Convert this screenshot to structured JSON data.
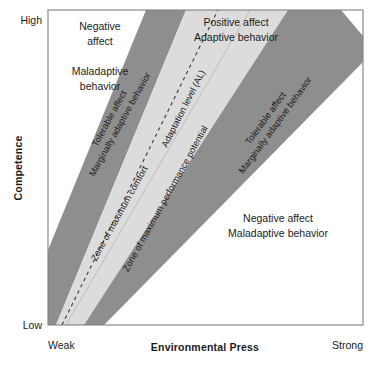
{
  "figure": {
    "type": "diagram",
    "model_name": "Environmental Press and Competence model",
    "plot_area": {
      "left": 48,
      "top": 10,
      "right": 363,
      "bottom": 325
    },
    "colors": {
      "background": "#ffffff",
      "frame": "#808080",
      "band_dark": "#8e8e8e",
      "band_light": "#dcdcdc",
      "text": "#1b1b1b",
      "dashed_line": "#3a3a3a"
    }
  },
  "axes": {
    "y": {
      "title": "Competence",
      "high_label": "High",
      "low_label": "Low"
    },
    "x": {
      "title": "Environmental Press",
      "weak_label": "Weak",
      "strong_label": "Strong"
    }
  },
  "quadrant_labels": [
    {
      "id": "upper-left",
      "lines": [
        "Negative",
        "affect"
      ],
      "x": 100,
      "y": 30
    },
    {
      "id": "upper-left-secondary",
      "lines": [
        "Maladaptive",
        "behavior"
      ],
      "x": 100,
      "y": 72
    },
    {
      "id": "upper-right",
      "lines": [
        "Positive affect",
        "Adaptive behavior"
      ],
      "x": 226,
      "y": 24
    },
    {
      "id": "lower-right",
      "lines": [
        "Negative affect",
        "Maladaptive behavior"
      ],
      "x": 264,
      "y": 219
    }
  ],
  "bands": [
    {
      "id": "left-tolerable-band",
      "shade": "dark",
      "lines": [
        "Tolerable affect",
        "Marginally adaptive behavior"
      ]
    },
    {
      "id": "zone-maximum-comfort",
      "shade": "light",
      "lines": [
        "Zone of maximum comfort"
      ]
    },
    {
      "id": "zone-maximum-performance",
      "shade": "light",
      "lines": [
        "Zone of maximum performance potential"
      ]
    },
    {
      "id": "right-tolerable-band",
      "shade": "dark",
      "lines": [
        "Tolerable affect",
        "Marginally adaptive behavior"
      ]
    }
  ],
  "adaptation_level": {
    "label": "Adaptation level (AL)",
    "style": "dashed"
  }
}
